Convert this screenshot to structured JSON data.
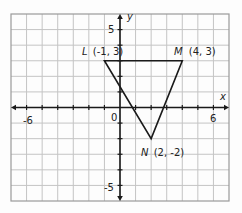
{
  "chart_data": {
    "type": "scatter",
    "title": "",
    "xlabel": "x",
    "ylabel": "y",
    "xlim": [
      -7,
      7
    ],
    "ylim": [
      -6,
      6
    ],
    "grid": true,
    "grid_step": 1,
    "x_tick_labels": [
      {
        "value": -6,
        "label": "-6"
      },
      {
        "value": 0,
        "label": "0"
      },
      {
        "value": 6,
        "label": "6"
      }
    ],
    "y_tick_labels": [
      {
        "value": 5,
        "label": "5"
      },
      {
        "value": -5,
        "label": "-5"
      }
    ],
    "shape": "triangle",
    "points": [
      {
        "name": "L",
        "x": -1,
        "y": 3,
        "label": "L (-1, 3)"
      },
      {
        "name": "M",
        "x": 4,
        "y": 3,
        "label": "M (4, 3)"
      },
      {
        "name": "N",
        "x": 2,
        "y": -2,
        "label": "N (2, -2)"
      }
    ],
    "edges": [
      [
        "L",
        "M"
      ],
      [
        "M",
        "N"
      ],
      [
        "N",
        "L"
      ]
    ]
  },
  "style": {
    "grid_color": "#c4c4c4",
    "frame_color": "#9a9a9a",
    "axis_color": "#1a1a1a",
    "shape_color": "#1a1a1a",
    "text_color": "#222222"
  },
  "labels": {
    "x_axis": "x",
    "y_axis": "y",
    "origin": "0",
    "x_neg6": "-6",
    "x_pos6": "6",
    "y_pos5": "5",
    "y_neg5": "-5",
    "point_L_name": "L",
    "point_L_coords": "(-1, 3)",
    "point_M_name": "M",
    "point_M_coords": "(4, 3)",
    "point_N_name": "N",
    "point_N_coords": "(2, -2)"
  }
}
